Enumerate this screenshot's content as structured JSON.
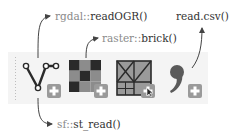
{
  "labels": {
    "rgdal": {
      "ns": "rgdal::",
      "fn": "readOGR()"
    },
    "raster": {
      "ns": "raster::",
      "fn": "brick()"
    },
    "csv": {
      "ns": "",
      "fn": "read.csv()"
    },
    "sf": {
      "ns": "sf::",
      "fn": "st_read()"
    }
  },
  "icons": [
    {
      "name": "vector-icon",
      "desc": "polyline with nodes"
    },
    {
      "name": "raster-icon",
      "desc": "checkerboard grid"
    },
    {
      "name": "geodatabase-icon",
      "desc": "grid with cross lines and cursor"
    },
    {
      "name": "text-file-icon",
      "desc": "comma glyph"
    }
  ],
  "add_badge": "+",
  "colors": {
    "band": "#f4f4f4",
    "icon_dark": "#2a2a2a",
    "icon_mid": "#8c8c8c",
    "badge": "#9a9a9a",
    "arrow": "#444444"
  }
}
